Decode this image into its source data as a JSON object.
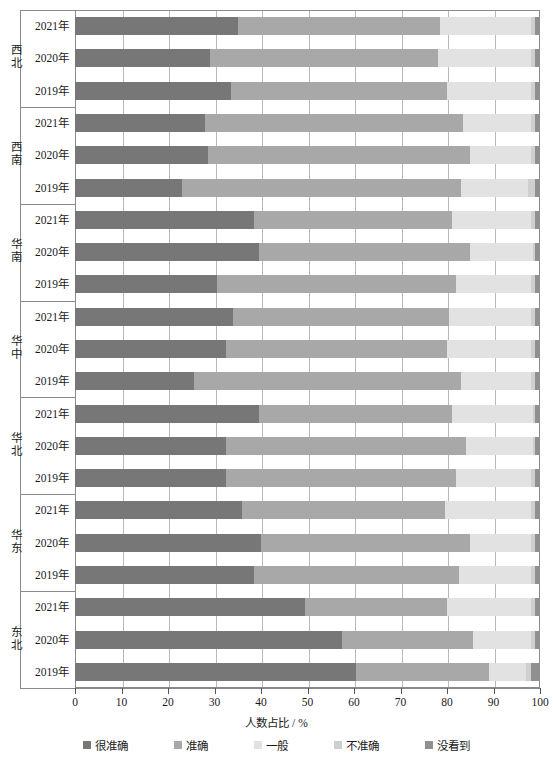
{
  "chart_data": {
    "type": "bar",
    "orientation": "horizontal",
    "stacked": true,
    "title": "",
    "xlabel": "人数占比 / %",
    "ylabel": "",
    "xlim": [
      0,
      100
    ],
    "xticks": [
      0,
      10,
      20,
      30,
      40,
      50,
      60,
      70,
      80,
      90,
      100
    ],
    "grid": true,
    "legend_position": "bottom",
    "series": [
      {
        "name": "很准确",
        "color": "#777777"
      },
      {
        "name": "准确",
        "color": "#a8a8a8"
      },
      {
        "name": "一般",
        "color": "#e2e2e2"
      },
      {
        "name": "不准确",
        "color": "#cfcfcf"
      },
      {
        "name": "没看到",
        "color": "#909090"
      }
    ],
    "groups": [
      {
        "region": "西北",
        "rows": [
          {
            "year": "2021年",
            "values": [
              35.0,
              43.5,
              19.5,
              1.0,
              1.0
            ]
          },
          {
            "year": "2020年",
            "values": [
              29.0,
              49.0,
              20.0,
              1.0,
              1.0
            ]
          },
          {
            "year": "2019年",
            "values": [
              33.5,
              46.5,
              18.0,
              1.0,
              1.0
            ]
          }
        ]
      },
      {
        "region": "西南",
        "rows": [
          {
            "year": "2021年",
            "values": [
              28.0,
              55.5,
              14.5,
              1.0,
              1.0
            ]
          },
          {
            "year": "2020年",
            "values": [
              28.5,
              56.5,
              13.0,
              1.0,
              1.0
            ]
          },
          {
            "year": "2019年",
            "values": [
              23.0,
              60.0,
              14.5,
              1.5,
              1.0
            ]
          }
        ]
      },
      {
        "region": "华南",
        "rows": [
          {
            "year": "2021年",
            "values": [
              38.5,
              42.5,
              17.0,
              1.0,
              1.0
            ]
          },
          {
            "year": "2020年",
            "values": [
              39.5,
              45.5,
              13.5,
              0.5,
              1.0
            ]
          },
          {
            "year": "2019年",
            "values": [
              30.5,
              51.5,
              16.0,
              1.0,
              1.0
            ]
          }
        ]
      },
      {
        "region": "华中",
        "rows": [
          {
            "year": "2021年",
            "values": [
              34.0,
              46.5,
              17.5,
              1.0,
              1.0
            ]
          },
          {
            "year": "2020年",
            "values": [
              32.5,
              47.5,
              18.0,
              1.0,
              1.0
            ]
          },
          {
            "year": "2019年",
            "values": [
              25.5,
              57.5,
              15.0,
              1.0,
              1.0
            ]
          }
        ]
      },
      {
        "region": "华北",
        "rows": [
          {
            "year": "2021年",
            "values": [
              39.5,
              41.5,
              17.5,
              0.5,
              1.0
            ]
          },
          {
            "year": "2020年",
            "values": [
              32.5,
              51.5,
              14.5,
              0.5,
              1.0
            ]
          },
          {
            "year": "2019年",
            "values": [
              32.5,
              49.5,
              16.0,
              1.0,
              1.0
            ]
          }
        ]
      },
      {
        "region": "华东",
        "rows": [
          {
            "year": "2021年",
            "values": [
              36.0,
              43.5,
              18.5,
              1.0,
              1.0
            ]
          },
          {
            "year": "2020年",
            "values": [
              40.0,
              45.0,
              13.0,
              1.0,
              1.0
            ]
          },
          {
            "year": "2019年",
            "values": [
              38.5,
              44.0,
              15.5,
              1.0,
              1.0
            ]
          }
        ]
      },
      {
        "region": "东北",
        "rows": [
          {
            "year": "2021年",
            "values": [
              49.5,
              30.5,
              18.0,
              1.0,
              1.0
            ]
          },
          {
            "year": "2020年",
            "values": [
              57.5,
              28.0,
              12.5,
              1.0,
              1.0
            ]
          },
          {
            "year": "2019年",
            "values": [
              60.5,
              28.5,
              8.0,
              1.0,
              2.0
            ]
          }
        ]
      }
    ]
  },
  "axis": {
    "x_title": "人数占比 / %",
    "tick_labels": [
      "0",
      "10",
      "20",
      "30",
      "40",
      "50",
      "60",
      "70",
      "80",
      "90",
      "100"
    ]
  },
  "legend": {
    "items": [
      {
        "label": "很准确",
        "color": "#777777"
      },
      {
        "label": "准确",
        "color": "#a8a8a8"
      },
      {
        "label": "一般",
        "color": "#e2e2e2"
      },
      {
        "label": "不准确",
        "color": "#cfcfcf"
      },
      {
        "label": "没看到",
        "color": "#909090"
      }
    ]
  }
}
